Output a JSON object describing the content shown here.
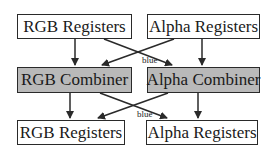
{
  "diagram": {
    "top_row": {
      "rgb": {
        "label": "RGB Registers"
      },
      "alpha": {
        "label": "Alpha Registers"
      }
    },
    "middle_row": {
      "rgb": {
        "label": "RGB Combiner"
      },
      "alpha": {
        "label": "Alpha Combiner"
      }
    },
    "bottom_row": {
      "rgb": {
        "label": "RGB Registers"
      },
      "alpha": {
        "label": "Alpha Registers"
      }
    },
    "edge_labels": {
      "upper_cross": "blue",
      "lower_cross": "blue"
    },
    "colors": {
      "register_fill": "#ffffff",
      "combiner_fill": "#b9b9b9",
      "stroke": "#2a2a2a"
    }
  }
}
